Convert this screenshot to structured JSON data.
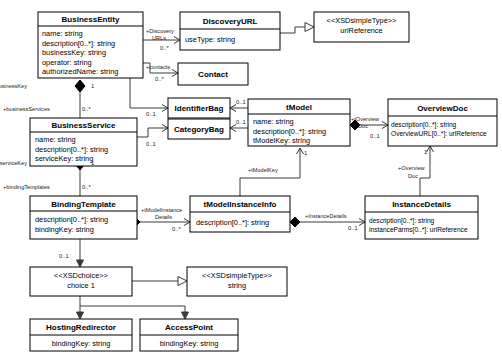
{
  "diagram": {
    "classes": [
      {
        "id": "businessEntity",
        "name": "BusinessEntity",
        "stereotype": "",
        "attributes": [
          "name: string",
          "description[0..*]: string",
          "businessKey: string",
          "operator: string",
          "authorizedName: string"
        ]
      },
      {
        "id": "discoveryURL",
        "name": "DiscoveryURL",
        "stereotype": "",
        "attributes": [
          "useType: string"
        ]
      },
      {
        "id": "urlReference",
        "name": "urlReference",
        "stereotype": "<<XSDsimpleType>>",
        "attributes": []
      },
      {
        "id": "contact",
        "name": "Contact",
        "stereotype": "",
        "attributes": []
      },
      {
        "id": "identifierBag",
        "name": "IdentifierBag",
        "stereotype": "",
        "attributes": []
      },
      {
        "id": "categoryBag",
        "name": "CategoryBag",
        "stereotype": "",
        "attributes": []
      },
      {
        "id": "businessService",
        "name": "BusinessService",
        "stereotype": "",
        "attributes": [
          "name: string",
          "description[0..*]: string",
          "serviceKey: string"
        ]
      },
      {
        "id": "tModel",
        "name": "tModel",
        "stereotype": "",
        "attributes": [
          "name: string",
          "description[0..*]: string",
          "tModelKey: string"
        ]
      },
      {
        "id": "overviewDoc",
        "name": "OverviewDoc",
        "stereotype": "",
        "attributes": [
          "description[0..*]: string",
          "OverviewURL[0..*]: urlReference"
        ]
      },
      {
        "id": "bindingTemplate",
        "name": "BindingTemplate",
        "stereotype": "",
        "attributes": [
          "description[0..*]: string",
          "bindingKey: string"
        ]
      },
      {
        "id": "tModelInstanceInfo",
        "name": "tModelInstanceInfo",
        "stereotype": "",
        "attributes": [
          "description[0..*]: string"
        ]
      },
      {
        "id": "instanceDetails",
        "name": "InstanceDetails",
        "stereotype": "",
        "attributes": [
          "description[0..*]: string",
          "instanceParms[0..*]: urlReference"
        ]
      },
      {
        "id": "xsdChoice",
        "name": "choice 1",
        "stereotype": "<<XSDchoice>>",
        "attributes": []
      },
      {
        "id": "xsdString",
        "name": "string",
        "stereotype": "<<XSDsimpleType>>",
        "attributes": []
      },
      {
        "id": "hostingRedirector",
        "name": "HostingRedirector",
        "stereotype": "",
        "attributes": [
          "bindingKey: string"
        ]
      },
      {
        "id": "accessPoint",
        "name": "AccessPoint",
        "stereotype": "",
        "attributes": [
          "bindingKey: string"
        ]
      }
    ],
    "relationships": [
      {
        "id": "be-discoveryurls",
        "from": "businessEntity",
        "to": "discoveryURL",
        "role": "+Discovery URLs",
        "multiplicity": "0..*",
        "kind": "association"
      },
      {
        "id": "be-contacts",
        "from": "businessEntity",
        "to": "contact",
        "role": "+contacts",
        "multiplicity": "0..*",
        "kind": "association"
      },
      {
        "id": "be-identifierbag",
        "from": "businessEntity",
        "to": "identifierBag",
        "role": "",
        "multiplicity": "0..1",
        "kind": "association"
      },
      {
        "id": "be-businesskey",
        "from": "businessEntity",
        "to": "businessService",
        "role": "+businessKey",
        "multiplicity": "1",
        "kind": "composition"
      },
      {
        "id": "be-businessservices",
        "from": "businessEntity",
        "to": "businessService",
        "role": "+businessServices",
        "multiplicity": "0..*",
        "kind": "composition"
      },
      {
        "id": "bs-categorybag",
        "from": "businessService",
        "to": "categoryBag",
        "role": "",
        "multiplicity": "0..1",
        "kind": "association"
      },
      {
        "id": "tm-identifierbag",
        "from": "tModel",
        "to": "identifierBag",
        "role": "",
        "multiplicity": "0..1",
        "kind": "association"
      },
      {
        "id": "tm-categorybag",
        "from": "tModel",
        "to": "categoryBag",
        "role": "",
        "multiplicity": "0..1",
        "kind": "association"
      },
      {
        "id": "tm-overviewdoc",
        "from": "tModel",
        "to": "overviewDoc",
        "role": "+tOverview Doc",
        "multiplicity": "0..1",
        "kind": "composition"
      },
      {
        "id": "durl-urlref",
        "from": "discoveryURL",
        "to": "urlReference",
        "role": "",
        "multiplicity": "",
        "kind": "generalization"
      },
      {
        "id": "bs-servicekey",
        "from": "businessService",
        "to": "bindingTemplate",
        "role": "+serviceKey",
        "multiplicity": "1",
        "kind": "composition"
      },
      {
        "id": "bs-bindingtemplates",
        "from": "businessService",
        "to": "bindingTemplate",
        "role": "+bindingTemplates",
        "multiplicity": "0..*",
        "kind": "composition"
      },
      {
        "id": "bt-tmodelinstance",
        "from": "bindingTemplate",
        "to": "tModelInstanceInfo",
        "role": "+tModelInstance Details",
        "multiplicity": "0..*",
        "kind": "composition"
      },
      {
        "id": "tmii-tmodelkey",
        "from": "tModelInstanceInfo",
        "to": "tModel",
        "role": "+tModelKey",
        "multiplicity": "1",
        "kind": "association"
      },
      {
        "id": "tmii-instancedetails",
        "from": "tModelInstanceInfo",
        "to": "instanceDetails",
        "role": "+InstanceDetails",
        "multiplicity": "0..1",
        "kind": "composition"
      },
      {
        "id": "id-overviewdoc",
        "from": "instanceDetails",
        "to": "overviewDoc",
        "role": "+Overview Doc",
        "multiplicity": "1",
        "kind": "association"
      },
      {
        "id": "bt-choice",
        "from": "bindingTemplate",
        "to": "xsdChoice",
        "role": "",
        "multiplicity": "0..1",
        "kind": "association"
      },
      {
        "id": "choice-string",
        "from": "xsdChoice",
        "to": "xsdString",
        "role": "",
        "multiplicity": "",
        "kind": "generalization"
      },
      {
        "id": "choice-hosting",
        "from": "xsdChoice",
        "to": "hostingRedirector",
        "role": "",
        "multiplicity": "",
        "kind": "association"
      },
      {
        "id": "choice-accesspoint",
        "from": "xsdChoice",
        "to": "accessPoint",
        "role": "",
        "multiplicity": "",
        "kind": "association"
      }
    ],
    "colors": {
      "box_fill": "#ffffff",
      "box_stroke": "#000000",
      "edge_stroke": "#3a3a3a",
      "diamond_fill": "#000000",
      "background": "#ffffff"
    }
  }
}
